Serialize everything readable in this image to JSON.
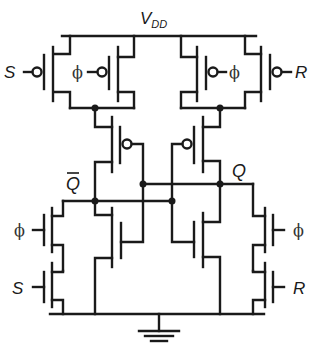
{
  "diagram": {
    "type": "circuit-schematic",
    "labels": {
      "vdd": "V",
      "vdd_sub": "DD",
      "s_top": "S",
      "phi_top_left": "ϕ",
      "phi_top_right": "ϕ",
      "r_top": "R",
      "q_bar": "Q",
      "q": "Q",
      "phi_bottom_left": "ϕ",
      "s_bottom": "S",
      "phi_bottom_right": "ϕ",
      "r_bottom": "R"
    },
    "components": [
      {
        "id": "pmos-s",
        "type": "PMOS",
        "gate": "S"
      },
      {
        "id": "pmos-phi-left",
        "type": "PMOS",
        "gate": "ϕ"
      },
      {
        "id": "pmos-phi-right",
        "type": "PMOS",
        "gate": "ϕ"
      },
      {
        "id": "pmos-r",
        "type": "PMOS",
        "gate": "R"
      },
      {
        "id": "pmos-cross-left",
        "type": "PMOS",
        "gate": "Q"
      },
      {
        "id": "pmos-cross-right",
        "type": "PMOS",
        "gate": "Q̄"
      },
      {
        "id": "nmos-cross-left",
        "type": "NMOS",
        "gate": "Q"
      },
      {
        "id": "nmos-cross-right",
        "type": "NMOS",
        "gate": "Q̄"
      },
      {
        "id": "nmos-phi-left",
        "type": "NMOS",
        "gate": "ϕ"
      },
      {
        "id": "nmos-s",
        "type": "NMOS",
        "gate": "S"
      },
      {
        "id": "nmos-phi-right",
        "type": "NMOS",
        "gate": "ϕ"
      },
      {
        "id": "nmos-r",
        "type": "NMOS",
        "gate": "R"
      }
    ],
    "colors": {
      "line": "#1a1a1a",
      "background": "#ffffff"
    }
  }
}
